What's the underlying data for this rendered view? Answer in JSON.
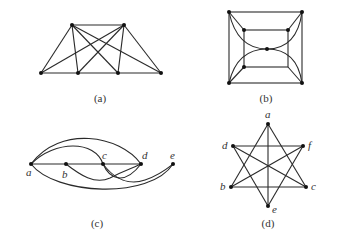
{
  "figures": [
    {
      "id": "a",
      "caption": "(a)"
    },
    {
      "id": "b",
      "caption": "(b)"
    },
    {
      "id": "c",
      "caption": "(c)",
      "vertex_labels": [
        "a",
        "b",
        "c",
        "d",
        "e"
      ]
    },
    {
      "id": "d",
      "caption": "(d)",
      "vertex_labels": [
        "a",
        "b",
        "c",
        "d",
        "e",
        "f"
      ]
    }
  ],
  "colors": {
    "edge": "#2a2a2a",
    "vertex": "#111111",
    "text": "#333333"
  }
}
